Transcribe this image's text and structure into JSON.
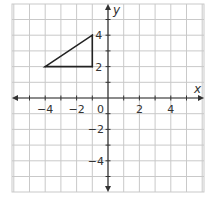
{
  "chart_data": {
    "type": "scatter",
    "title": "",
    "xlabel": "x",
    "ylabel": "y",
    "xlim": [
      -6,
      6
    ],
    "ylim": [
      -6,
      6
    ],
    "grid": true,
    "x_tick_labels": [
      {
        "value": -4,
        "label": "−4"
      },
      {
        "value": -2,
        "label": "−2"
      },
      {
        "value": 2,
        "label": "2"
      },
      {
        "value": 4,
        "label": "4"
      }
    ],
    "y_tick_labels": [
      {
        "value": 4,
        "label": "4"
      },
      {
        "value": 2,
        "label": "2"
      },
      {
        "value": -2,
        "label": "−2"
      },
      {
        "value": -4,
        "label": "−4"
      }
    ],
    "origin_label": "0",
    "polygon": {
      "name": "triangle",
      "vertices": [
        [
          -4,
          2
        ],
        [
          -1,
          4
        ],
        [
          -1,
          2
        ]
      ]
    }
  }
}
